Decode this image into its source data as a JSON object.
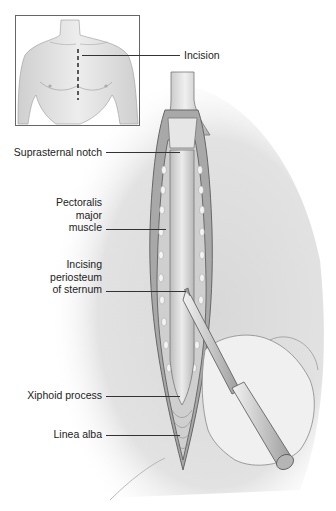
{
  "figure": {
    "inset": {
      "description": "Male torso with dashed midline incision",
      "label": "Incision"
    },
    "labels": [
      {
        "id": "suprasternal-notch",
        "text": "Suprasternal notch"
      },
      {
        "id": "pectoralis-major",
        "lines": [
          "Pectoralis",
          "major",
          "muscle"
        ]
      },
      {
        "id": "incising-periosteum",
        "lines": [
          "Incising",
          "periosteum",
          "of sternum"
        ]
      },
      {
        "id": "xiphoid-process",
        "text": "Xiphoid process"
      },
      {
        "id": "linea-alba",
        "text": "Linea alba"
      }
    ]
  },
  "colors": {
    "background": "#ffffff",
    "skin": "#e4e4e4",
    "shadow": "#bdbdbd",
    "outline": "#555555",
    "label_text": "#222222",
    "leader_line": "#333333"
  }
}
